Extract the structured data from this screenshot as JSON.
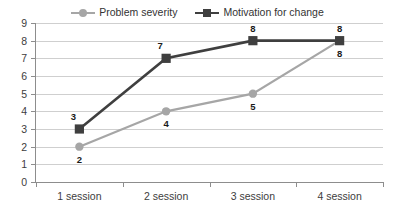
{
  "chart_data": {
    "type": "line",
    "title": "",
    "xlabel": "",
    "ylabel": "",
    "ylim": [
      0,
      9
    ],
    "grid": true,
    "legend_position": "top-center",
    "categories": [
      "1 session",
      "2 session",
      "3 session",
      "4 session"
    ],
    "y_ticks": [
      "0",
      "1",
      "2",
      "3",
      "4",
      "5",
      "6",
      "7",
      "8",
      "9"
    ],
    "series": [
      {
        "name": "Problem severity",
        "color": "#a6a6a6",
        "marker": "circle",
        "values": [
          2,
          4,
          5,
          8
        ],
        "labels": [
          "2",
          "4",
          "5",
          "8"
        ],
        "label_position": "below"
      },
      {
        "name": "Motivation for change",
        "color": "#3f3f3f",
        "marker": "square",
        "values": [
          3,
          7,
          8,
          8
        ],
        "labels": [
          "3",
          "7",
          "8",
          "8"
        ],
        "label_position": "above"
      }
    ]
  },
  "legend": {
    "items": [
      {
        "label": "Problem severity",
        "color": "#a6a6a6",
        "marker": "circle"
      },
      {
        "label": "Motivation for change",
        "color": "#3f3f3f",
        "marker": "square"
      }
    ]
  },
  "axes": {
    "y_min_label": "0",
    "y_max_label": "9"
  }
}
